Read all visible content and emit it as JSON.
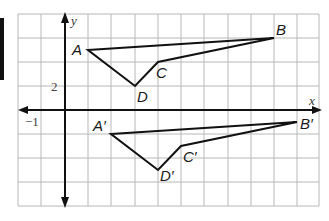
{
  "diagram": {
    "type": "coordinate-plane-translation",
    "axes": {
      "x_label": "x",
      "y_label": "y"
    },
    "tick_labels": {
      "y_tick": "2",
      "x_tick": "−1"
    },
    "grid": {
      "columns": 13,
      "rows": 8,
      "x_unit_per_cell": 1,
      "y_unit_per_cell": 2
    },
    "original_figure": {
      "labels": {
        "A": "A",
        "B": "B",
        "C": "C",
        "D": "D"
      },
      "vertices": {
        "A": [
          1,
          7
        ],
        "B": [
          9,
          8
        ],
        "C": [
          4,
          6
        ],
        "D": [
          3,
          2
        ]
      }
    },
    "image_figure": {
      "labels": {
        "A": "A′",
        "B": "B′",
        "C": "C′",
        "D": "D′"
      },
      "vertices": {
        "A": [
          2,
          -2
        ],
        "B": [
          10,
          -1
        ],
        "C": [
          5,
          -3
        ],
        "D": [
          4,
          -5
        ]
      }
    },
    "colors": {
      "grid": "#b8b8b8",
      "axis": "#111111",
      "figure": "#111111"
    }
  }
}
